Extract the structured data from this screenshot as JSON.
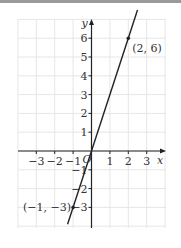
{
  "chart_data": {
    "type": "line",
    "title": "",
    "xlabel": "x",
    "ylabel": "y",
    "origin_label": "O",
    "xlim": [
      -4,
      4
    ],
    "ylim": [
      -4,
      7
    ],
    "grid": true,
    "x_ticks": [
      -3,
      -2,
      -1,
      1,
      2,
      3
    ],
    "y_ticks": [
      -3,
      -2,
      -1,
      1,
      2,
      3,
      4,
      5,
      6
    ],
    "x_tick_labels": [
      "−3",
      "−2",
      "−1",
      "1",
      "2",
      "3"
    ],
    "y_tick_labels": [
      "−3",
      "−2",
      "−1",
      "1",
      "2",
      "3",
      "4",
      "5",
      "6"
    ],
    "series": [
      {
        "name": "y = 3x",
        "equation": "y = 3x",
        "x": [
          -1.3,
          2.5
        ],
        "y": [
          -3.9,
          7.5
        ],
        "color": "#222222"
      }
    ],
    "points": [
      {
        "x": 2,
        "y": 6,
        "label": "(2, 6)"
      },
      {
        "x": -1,
        "y": -3,
        "label": "(−1, −3)"
      }
    ]
  }
}
